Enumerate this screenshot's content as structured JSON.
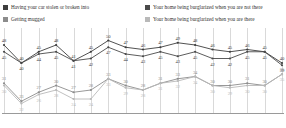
{
  "legend": {
    "items": [
      {
        "label": "Having your car stolen or broken into",
        "color": "#3d3d3d",
        "key": "car"
      },
      {
        "label": "Getting mugged",
        "color": "#8c8c8c",
        "key": "mugged"
      },
      {
        "label": "Your home being burglarized when you are not there",
        "color": "#4a4a4a",
        "key": "burg_not_there"
      },
      {
        "label": "Your home being burglarized when you are there",
        "color": "#b9b9b9",
        "key": "burg_there"
      }
    ]
  },
  "chart_data": {
    "type": "line",
    "title": "",
    "subtitle": "",
    "xlabel": "",
    "ylabel": "",
    "ylim": [
      20,
      52
    ],
    "grid": true,
    "legend_position": "top",
    "x": [
      1,
      2,
      3,
      4,
      5,
      6,
      7,
      8,
      9,
      10,
      11,
      12,
      13,
      14,
      15,
      16,
      17
    ],
    "series": [
      {
        "name": "Having your car stolen or broken into",
        "color": "#3d3d3d",
        "values": [
          48,
          40,
          45,
          48,
          41,
          45,
          50,
          47,
          46,
          47,
          49,
          48,
          46,
          45,
          46,
          45,
          40
        ]
      },
      {
        "name": "Your home being burglarized when you are not there",
        "color": "#4a4a4a",
        "values": [
          45,
          40,
          44,
          45,
          41,
          42,
          47,
          44,
          43,
          45,
          43,
          45,
          42,
          42,
          45,
          45,
          39
        ]
      },
      {
        "name": "Getting mugged",
        "color": "#8c8c8c",
        "values": [
          31,
          23,
          27,
          30,
          27,
          28,
          33,
          30,
          28,
          31,
          33,
          34,
          30,
          30,
          31,
          30,
          35
        ]
      },
      {
        "name": "Your home being burglarized when you are there",
        "color": "#b9b9b9",
        "values": [
          30,
          22,
          26,
          28,
          24,
          24,
          33,
          29,
          28,
          31,
          32,
          34,
          30,
          29,
          30,
          30,
          35
        ]
      }
    ]
  }
}
